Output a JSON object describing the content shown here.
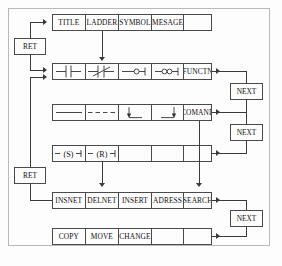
{
  "diagram": {
    "frame_color": "#b9b9b9",
    "line_color": "#3a3a3a",
    "box_border_color": "#4a4a4a"
  },
  "rows": [
    {
      "name": "row-main-menu",
      "cells": [
        {
          "label": "TITLE",
          "kind": "text"
        },
        {
          "label": "LADDER",
          "kind": "text"
        },
        {
          "label": "SYMBOL",
          "kind": "text"
        },
        {
          "label": "MESAGE",
          "kind": "text"
        },
        {
          "label": "",
          "kind": "blank"
        }
      ]
    },
    {
      "name": "row-contacts",
      "cells": [
        {
          "label": "",
          "kind": "glyph",
          "glyph": "contact-no"
        },
        {
          "label": "",
          "kind": "glyph",
          "glyph": "contact-nc"
        },
        {
          "label": "",
          "kind": "glyph",
          "glyph": "contact-circle"
        },
        {
          "label": "",
          "kind": "glyph",
          "glyph": "contact-double-circle"
        },
        {
          "label": "FUNCTN",
          "kind": "text"
        }
      ]
    },
    {
      "name": "row-lines",
      "cells": [
        {
          "label": "",
          "kind": "glyph",
          "glyph": "line-solid"
        },
        {
          "label": "",
          "kind": "glyph",
          "glyph": "line-dashed"
        },
        {
          "label": "",
          "kind": "glyph",
          "glyph": "branch-left"
        },
        {
          "label": "",
          "kind": "glyph",
          "glyph": "branch-right"
        },
        {
          "label": "COMAND",
          "kind": "text"
        }
      ]
    },
    {
      "name": "row-coils",
      "cells": [
        {
          "label": "",
          "kind": "glyph",
          "glyph": "coil-set"
        },
        {
          "label": "",
          "kind": "glyph",
          "glyph": "coil-reset"
        },
        {
          "label": "",
          "kind": "blank"
        },
        {
          "label": "",
          "kind": "blank"
        },
        {
          "label": "",
          "kind": "blank"
        }
      ]
    },
    {
      "name": "row-edit",
      "cells": [
        {
          "label": "INSNET",
          "kind": "text"
        },
        {
          "label": "DELNET",
          "kind": "text"
        },
        {
          "label": "INSERT",
          "kind": "text"
        },
        {
          "label": "ADRESS",
          "kind": "text"
        },
        {
          "label": "SEARCH",
          "kind": "text"
        }
      ]
    },
    {
      "name": "row-clipboard",
      "cells": [
        {
          "label": "COPY",
          "kind": "text"
        },
        {
          "label": "MOVE",
          "kind": "text"
        },
        {
          "label": "CHANGE",
          "kind": "text"
        },
        {
          "label": "",
          "kind": "blank"
        },
        {
          "label": "",
          "kind": "blank"
        }
      ]
    }
  ],
  "side_boxes": {
    "ret_top": "RET",
    "ret_bottom": "RET",
    "next_1": "NEXT",
    "next_2": "NEXT",
    "next_3": "NEXT"
  },
  "caption": ""
}
